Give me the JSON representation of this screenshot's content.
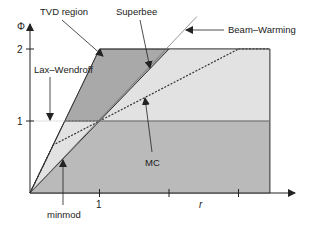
{
  "axes": {
    "y_label": "Φ",
    "x_label": "r",
    "y_ticks": [
      {
        "value": 1,
        "label": "1"
      },
      {
        "value": 2,
        "label": "2"
      }
    ],
    "x_ticks": [
      {
        "value": 1,
        "label": "1"
      },
      {
        "value": 2,
        "label": ""
      },
      {
        "value": 3,
        "label": ""
      }
    ],
    "x_range": [
      0,
      3.45
    ],
    "y_range": [
      0,
      2
    ]
  },
  "colors": {
    "tvd_region": "#a9a9a9",
    "minmod_region": "#bababa",
    "between_region": "#e2e2e2",
    "line": "#333333"
  },
  "annotations": {
    "tvd": "TVD region",
    "superbee": "Superbee",
    "beam_warming": "Beam–Warming",
    "lax_wendroff": "Lax–Wendroff",
    "mc": "MC",
    "minmod": "minmod"
  },
  "limiters": [
    {
      "name": "minmod",
      "formula": "max(0, min(r, 1))"
    },
    {
      "name": "Superbee",
      "formula": "max(0, min(2r, 1), min(r, 2))"
    },
    {
      "name": "MC",
      "formula": "max(0, min(2r, (1+r)/2, 2))"
    },
    {
      "name": "Lax–Wendroff",
      "formula": "Φ = 1"
    },
    {
      "name": "Beam–Warming",
      "formula": "Φ = r"
    }
  ]
}
